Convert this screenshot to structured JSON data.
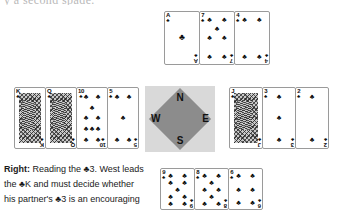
{
  "top_clip_text": "y a second spade.",
  "compass": {
    "north": "N",
    "south": "S",
    "west": "W",
    "east": "E",
    "diamond_color": "#8c8c8c",
    "background_color": "#d9d9d9"
  },
  "suit_symbol": "♣",
  "hands": {
    "north": {
      "label": "North",
      "cards": [
        {
          "rank": "A",
          "suit": "♣",
          "pips": 1,
          "face": false
        },
        {
          "rank": "7",
          "suit": "♣",
          "pips": 7,
          "face": false
        },
        {
          "rank": "4",
          "suit": "♣",
          "pips": 4,
          "face": false
        }
      ]
    },
    "west": {
      "label": "West",
      "cards": [
        {
          "rank": "K",
          "suit": "♣",
          "pips": 0,
          "face": true
        },
        {
          "rank": "Q",
          "suit": "♣",
          "pips": 0,
          "face": true
        },
        {
          "rank": "10",
          "suit": "♣",
          "pips": 10,
          "face": false
        },
        {
          "rank": "5",
          "suit": "♣",
          "pips": 5,
          "face": false
        }
      ]
    },
    "east": {
      "label": "East",
      "cards": [
        {
          "rank": "J",
          "suit": "♣",
          "pips": 0,
          "face": true
        },
        {
          "rank": "3",
          "suit": "♣",
          "pips": 3,
          "face": false
        },
        {
          "rank": "2",
          "suit": "♣",
          "pips": 2,
          "face": false
        }
      ]
    },
    "south": {
      "label": "South",
      "cards": [
        {
          "rank": "9",
          "suit": "♣",
          "pips": 9,
          "face": false
        },
        {
          "rank": "8",
          "suit": "♣",
          "pips": 8,
          "face": false
        },
        {
          "rank": "6",
          "suit": "♣",
          "pips": 6,
          "face": false
        }
      ]
    }
  },
  "caption": {
    "lead": "Right:",
    "line1_rest": " Reading the ♣3. West leads",
    "line2": "the ♣K and must decide whether",
    "line3": "his partner's ♣3 is an encouraging"
  }
}
